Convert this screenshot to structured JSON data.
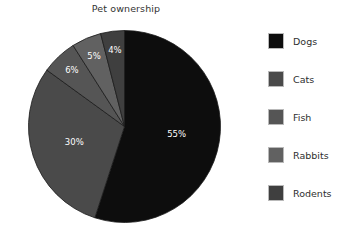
{
  "chart_data": {
    "type": "pie",
    "title": "Pet ownership",
    "xlabel": "",
    "ylabel": "",
    "categories": [
      "Dogs",
      "Cats",
      "Fish",
      "Rabbits",
      "Rodents"
    ],
    "values": [
      55,
      30,
      6,
      5,
      4
    ],
    "value_labels": [
      "55%",
      "30%",
      "6%",
      "5%",
      "4%"
    ],
    "colors": [
      "#0d0d0d",
      "#4a4a4a",
      "#555555",
      "#616161",
      "#3f3f3f"
    ],
    "legend_position": "right",
    "grid": false,
    "start_angle_oclock": 12,
    "direction": "clockwise",
    "slice_label_color": "#ffffff",
    "background": "#ffffff",
    "slices": [
      {
        "label": "Dogs",
        "value": 55,
        "display": "55%",
        "color": "#0d0d0d"
      },
      {
        "label": "Cats",
        "value": 30,
        "display": "30%",
        "color": "#4a4a4a"
      },
      {
        "label": "Fish",
        "value": 6,
        "display": "6%",
        "color": "#555555"
      },
      {
        "label": "Rabbits",
        "value": 5,
        "display": "5%",
        "color": "#616161"
      },
      {
        "label": "Rodents",
        "value": 4,
        "display": "4%",
        "color": "#3f3f3f"
      }
    ]
  },
  "legend": {
    "items": [
      {
        "label": "Dogs",
        "color": "#0d0d0d"
      },
      {
        "label": "Cats",
        "color": "#4a4a4a"
      },
      {
        "label": "Fish",
        "color": "#555555"
      },
      {
        "label": "Rabbits",
        "color": "#616161"
      },
      {
        "label": "Rodents",
        "color": "#3f3f3f"
      }
    ]
  }
}
